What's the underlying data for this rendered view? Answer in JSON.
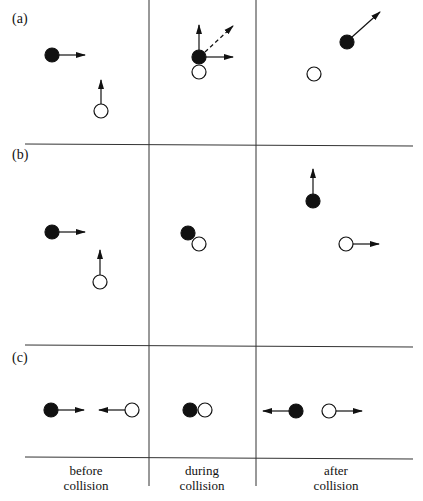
{
  "figure": {
    "rows": [
      {
        "label": "(a)",
        "description": "oblique collision, with resultant velocity shown dashed"
      },
      {
        "label": "(b)",
        "description": "glancing collision, velocities exchanged at right angles"
      },
      {
        "label": "(c)",
        "description": "head-on collision"
      }
    ],
    "columns": [
      {
        "caption_line1": "before",
        "caption_line2": "collision"
      },
      {
        "caption_line1": "during",
        "caption_line2": "collision"
      },
      {
        "caption_line1": "after",
        "caption_line2": "collision"
      }
    ],
    "legend": {
      "filled_circle": "particle 1 (black)",
      "open_circle": "particle 2 (white)"
    },
    "colors": {
      "ink": "#111111",
      "background": "#ffffff",
      "grid": "#333333"
    }
  }
}
